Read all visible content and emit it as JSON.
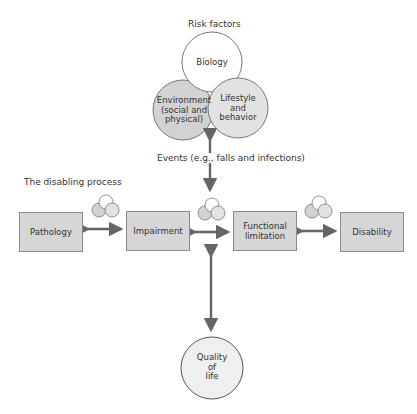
{
  "header": {
    "risk_factors_title": "Risk factors"
  },
  "risk_factors": {
    "biology": "Biology",
    "environment": [
      "Environment",
      "(social and",
      "physical)"
    ],
    "lifestyle": [
      "Lifestyle",
      "and",
      "behavior"
    ]
  },
  "events_label": "Events (e.g., falls and infections)",
  "process_title": "The disabling process",
  "process_steps": [
    {
      "label": [
        "Pathology"
      ]
    },
    {
      "label": [
        "Impairment"
      ]
    },
    {
      "label": [
        "Functional",
        "limitation"
      ]
    },
    {
      "label": [
        "Disability"
      ]
    }
  ],
  "outcome": [
    "Quality",
    "of",
    "life"
  ],
  "colors": {
    "box_fill": "#d6d6d6",
    "box_border": "#8a8a8a",
    "arrow": "#666666",
    "env_fill": "#d2d2d2",
    "lifestyle_fill": "#e2e2e2",
    "biology_fill": "#ffffff",
    "qol_fill": "#efefef"
  }
}
